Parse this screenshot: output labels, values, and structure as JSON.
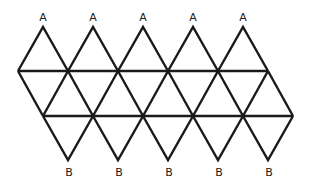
{
  "diagram": {
    "stroke_color": "#1a1a1a",
    "background": "#ffffff",
    "top_labels": [
      "A",
      "A",
      "A",
      "A",
      "A"
    ],
    "bottom_labels": [
      "B",
      "B",
      "B",
      "B",
      "B"
    ],
    "triangle_count": 20
  }
}
